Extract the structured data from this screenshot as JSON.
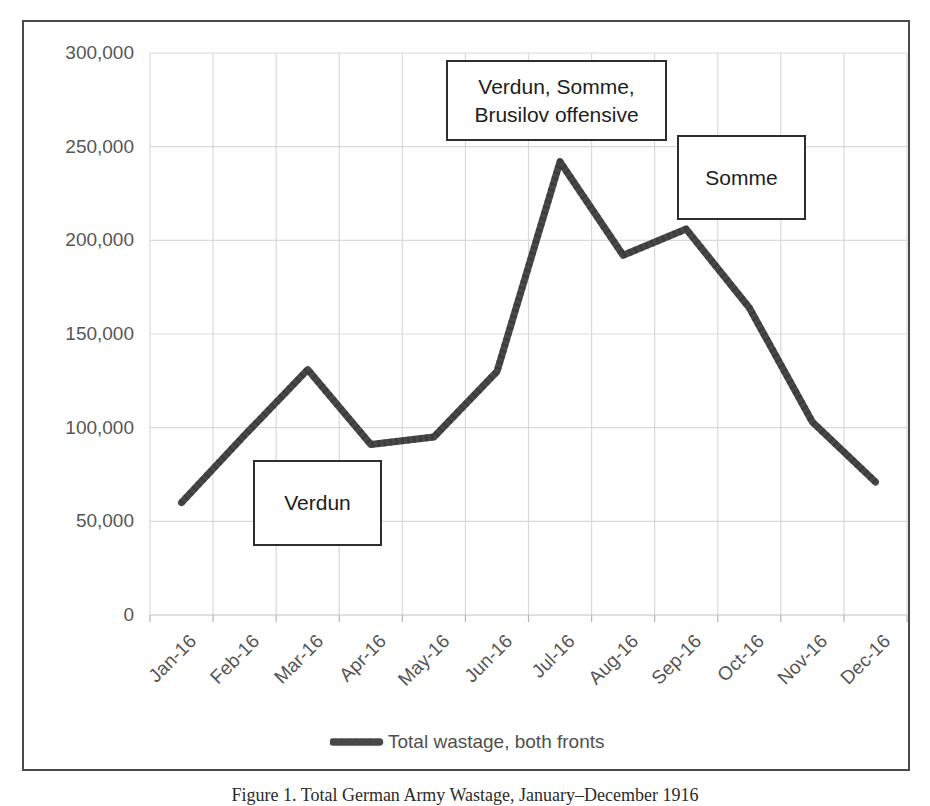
{
  "figure": {
    "caption": "Figure 1. Total German Army Wastage, January–December 1916"
  },
  "chart_data": {
    "type": "line",
    "title": "",
    "categories": [
      "Jan-16",
      "Feb-16",
      "Mar-16",
      "Apr-16",
      "May-16",
      "Jun-16",
      "Jul-16",
      "Aug-16",
      "Sep-16",
      "Oct-16",
      "Nov-16",
      "Dec-16"
    ],
    "series": [
      {
        "name": "Total wastage, both fronts",
        "values": [
          60000,
          96000,
          131000,
          91000,
          95000,
          130000,
          242000,
          192000,
          206000,
          164000,
          103000,
          71000
        ]
      }
    ],
    "xlabel": "",
    "ylabel": "",
    "ylim": [
      0,
      300000
    ],
    "ytick_step": 50000,
    "ytick_labels": [
      "0",
      "50,000",
      "100,000",
      "150,000",
      "200,000",
      "250,000",
      "300,000"
    ],
    "grid": "both",
    "legend_position": "bottom",
    "annotations": [
      {
        "id": "verdun-somme-brusilov",
        "text": "Verdun, Somme,\nBrusilov offensive"
      },
      {
        "id": "somme",
        "text": "Somme"
      },
      {
        "id": "verdun",
        "text": "Verdun"
      }
    ]
  },
  "colors": {
    "series_line": "#484848",
    "gridline": "#d9d9d9",
    "axis_line": "#c2c2c2",
    "tick_mark": "#b5b5b5",
    "tick_text": "#565656",
    "annotation_border": "#2e2e2e",
    "frame_border": "#4a4a4a",
    "background": "#ffffff"
  }
}
